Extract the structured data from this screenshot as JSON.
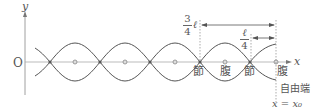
{
  "axes": {
    "y_label": "y",
    "x_label": "x",
    "origin_label": "O"
  },
  "labels": {
    "node1": "節",
    "antinode1": "腹",
    "node2": "節",
    "antinode2": "腹",
    "free_end": "自由端",
    "x_position": "x = x₀"
  },
  "dimensions": {
    "long": {
      "numerator": "3",
      "denominator": "4",
      "suffix": "ℓ"
    },
    "short": {
      "numerator": "ℓ",
      "denominator": "4"
    }
  },
  "colors": {
    "curve": "#555555",
    "axis": "#999999",
    "dashed": "#888888"
  }
}
